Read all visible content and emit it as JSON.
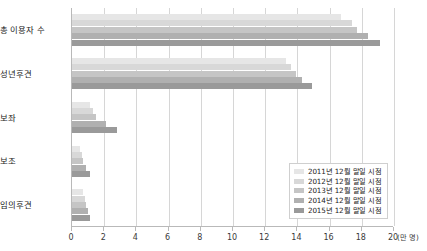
{
  "chart_data": {
    "type": "bar",
    "orientation": "horizontal",
    "title": "",
    "xlabel": "(만 명)",
    "ylabel": "",
    "xlim": [
      0,
      20
    ],
    "xticks": [
      0,
      2,
      4,
      6,
      8,
      10,
      12,
      14,
      16,
      18,
      20
    ],
    "grid": true,
    "legend_position": "bottom-right",
    "categories": [
      "총 이용자 수",
      "성년후견",
      "보좌",
      "보조",
      "임의후견"
    ],
    "series": [
      {
        "name": "2011년 12월 말일 시점",
        "color": "#e6e6e6",
        "values": [
          16.7,
          13.3,
          1.1,
          0.5,
          0.7
        ]
      },
      {
        "name": "2012년 12월 말일 시점",
        "color": "#d8d8d8",
        "values": [
          17.4,
          13.6,
          1.3,
          0.6,
          0.8
        ]
      },
      {
        "name": "2013년 12월 말일 시점",
        "color": "#c5c5c5",
        "values": [
          17.7,
          13.9,
          1.5,
          0.7,
          0.9
        ]
      },
      {
        "name": "2014년 12월 말일 시점",
        "color": "#b0b0b0",
        "values": [
          18.4,
          14.3,
          2.1,
          0.9,
          1.0
        ]
      },
      {
        "name": "2015년 12월 말일 시점",
        "color": "#9a9a9a",
        "values": [
          19.1,
          14.9,
          2.8,
          1.1,
          1.1
        ]
      }
    ]
  },
  "axis": {
    "unit_label": "(만 명)"
  }
}
